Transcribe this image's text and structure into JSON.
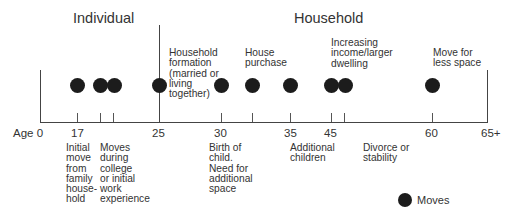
{
  "diagram": {
    "sections": {
      "individual": "Individual",
      "household": "Household"
    },
    "axis": {
      "prefix": "Age",
      "ticks": [
        {
          "label": "0",
          "x": 40
        },
        {
          "label": "17",
          "x": 77
        },
        {
          "label": "",
          "x": 100
        },
        {
          "label": "",
          "x": 113
        },
        {
          "label": "25",
          "x": 159
        },
        {
          "label": "30",
          "x": 221
        },
        {
          "label": "",
          "x": 252
        },
        {
          "label": "35",
          "x": 290
        },
        {
          "label": "45",
          "x": 331
        },
        {
          "label": "",
          "x": 344
        },
        {
          "label": "60",
          "x": 432
        },
        {
          "label": "65+",
          "x": 487
        }
      ]
    },
    "moves_x": [
      77,
      100,
      114,
      159,
      221,
      252,
      290,
      331,
      345,
      432
    ],
    "events_above": [
      {
        "text": "Household\nformation\n(married or\nliving\ntogether)"
      },
      {
        "text": "House\npurchase"
      },
      {
        "text": "Increasing\nincome/larger\ndwelling"
      },
      {
        "text": "Move for\nless space"
      }
    ],
    "events_below": [
      {
        "text": "Initial\nmove\nfrom\nfamily\nhouse-\nhold"
      },
      {
        "text": "Moves\nduring\ncollege\nor initial\nwork\nexperience"
      },
      {
        "text": "Birth of\nchild.\nNeed for\nadditional\nspace"
      },
      {
        "text": "Additional\nchildren"
      },
      {
        "text": "Divorce or\nstability"
      }
    ],
    "legend": {
      "label": "Moves"
    }
  }
}
